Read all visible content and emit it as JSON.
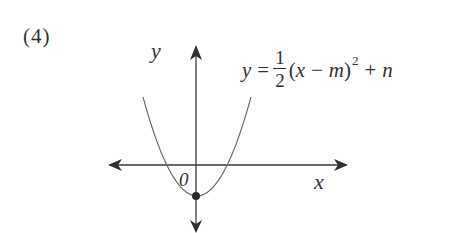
{
  "problem": {
    "number": "(4)"
  },
  "equation": {
    "lhs": "y",
    "equals": "=",
    "fraction_numerator": "1",
    "fraction_denominator": "2",
    "open_paren": "(",
    "var_x": "x",
    "minus": "−",
    "var_m": "m",
    "close_paren": ")",
    "exponent": "2",
    "plus": "+",
    "var_n": "n",
    "full_text": "y = 1/2 (x − m)^2 + n"
  },
  "axes": {
    "x_label": "x",
    "y_label": "y",
    "origin_label": "0"
  },
  "graph": {
    "type": "parabola",
    "opens": "up",
    "vertex_marker": "filled-dot on negative y-axis",
    "colors": {
      "axis": "#3a3a3a",
      "curve": "#6a6a6a",
      "dot": "#2a2a2a",
      "text": "#333333"
    }
  }
}
